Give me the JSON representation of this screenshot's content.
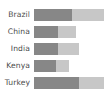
{
  "chart_data": {
    "type": "bar",
    "orientation": "horizontal",
    "stacked": true,
    "title": "",
    "subtitle": "",
    "xlabel": "",
    "ylabel": "",
    "grid": false,
    "legend": "none",
    "xlim": [
      0,
      70
    ],
    "categories": [
      "Brazil",
      "China",
      "India",
      "Kenya",
      "Turkey"
    ],
    "series": [
      {
        "name": "segment-1",
        "color": "#878787",
        "values": [
          38,
          24,
          24,
          22,
          45
        ]
      },
      {
        "name": "segment-2",
        "color": "#c7c7c7",
        "values": [
          32,
          18,
          21,
          13,
          25
        ]
      }
    ],
    "totals": [
      70,
      42,
      45,
      35,
      70
    ]
  },
  "colors": {
    "background": "#ffffff",
    "label_text": "#4a4a4a",
    "series_1": "#878787",
    "series_2": "#c7c7c7"
  }
}
